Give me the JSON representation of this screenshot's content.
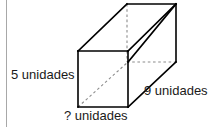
{
  "figure": {
    "kind": "rectangular-prism-diagram",
    "background_color": "#ffffff",
    "edge_color": "#000000",
    "hidden_edge_color": "#8c8c8c",
    "text_color": "#1a1a1a",
    "margin_rule_color": "#a8a8a8",
    "labels": {
      "height": "5 unidades",
      "depth": "9 unidades",
      "width": "? unidades"
    },
    "geometry": {
      "front_top_left": [
        78,
        51
      ],
      "front_top_right": [
        128,
        51
      ],
      "front_bottom_right": [
        128,
        107
      ],
      "front_bottom_left": [
        78,
        107
      ],
      "back_top_left": [
        127,
        4
      ],
      "back_top_right": [
        176,
        4
      ],
      "back_bottom_right": [
        176,
        62
      ],
      "back_bottom_left": [
        127,
        62
      ],
      "solid_edges": [
        [
          [
            78,
            51
          ],
          [
            128,
            51
          ]
        ],
        [
          [
            128,
            51
          ],
          [
            128,
            107
          ]
        ],
        [
          [
            128,
            107
          ],
          [
            78,
            107
          ]
        ],
        [
          [
            78,
            107
          ],
          [
            78,
            51
          ]
        ],
        [
          [
            78,
            51
          ],
          [
            127,
            4
          ]
        ],
        [
          [
            128,
            51
          ],
          [
            176,
            4
          ]
        ],
        [
          [
            127,
            4
          ],
          [
            176,
            4
          ]
        ],
        [
          [
            176,
            4
          ],
          [
            176,
            62
          ]
        ],
        [
          [
            128,
            107
          ],
          [
            176,
            62
          ]
        ],
        [
          [
            128,
            62
          ],
          [
            176,
            4
          ]
        ]
      ],
      "hidden_edges": [
        [
          [
            127,
            4
          ],
          [
            127,
            62
          ]
        ],
        [
          [
            127,
            62
          ],
          [
            176,
            62
          ]
        ],
        [
          [
            78,
            107
          ],
          [
            128,
            62
          ]
        ]
      ]
    },
    "margin_rule": {
      "x": 6,
      "y_start": 0,
      "y_end": 127
    }
  }
}
